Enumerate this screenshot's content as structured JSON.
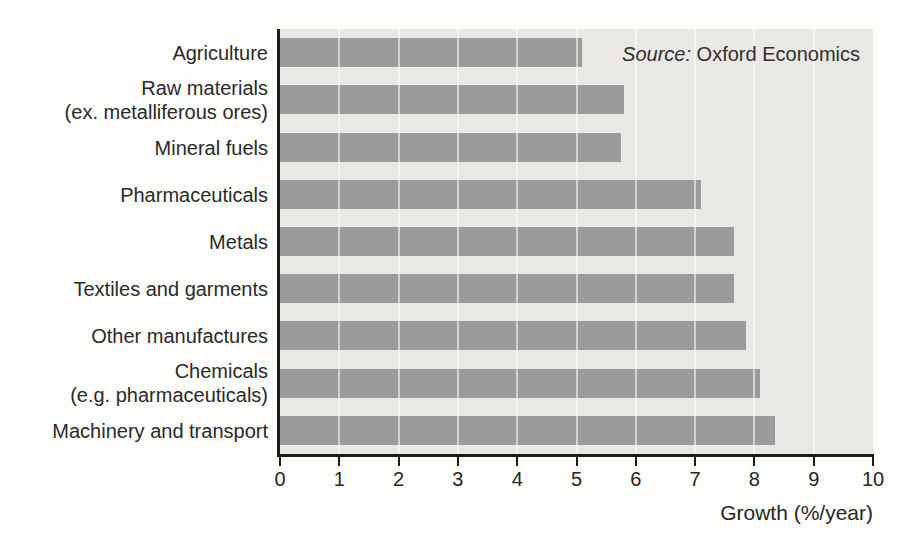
{
  "chart_data": {
    "type": "bar",
    "orientation": "horizontal",
    "title": "",
    "xlabel": "Growth (%/year)",
    "ylabel": "",
    "xlim": [
      0,
      10
    ],
    "xticks": [
      0,
      1,
      2,
      3,
      4,
      5,
      6,
      7,
      8,
      9,
      10
    ],
    "grid": "vertical white gridlines at each integer tick, drawn across plot and bars",
    "legend": "none",
    "categories": [
      "Agriculture",
      "Raw materials\n(ex. metalliferous ores)",
      "Mineral fuels",
      "Pharmaceuticals",
      "Metals",
      "Textiles and garments",
      "Other manufactures",
      "Chemicals\n(e.g. pharmaceuticals)",
      "Machinery and transport"
    ],
    "values": [
      5.1,
      5.8,
      5.75,
      7.1,
      7.65,
      7.65,
      7.85,
      8.1,
      8.35
    ],
    "bar_color": "#9b9b9b",
    "plot_background": "#e9e8e5",
    "axis_color": "#1c1c1c"
  },
  "source": {
    "prefix": "Source:",
    "name": " Oxford Economics"
  }
}
